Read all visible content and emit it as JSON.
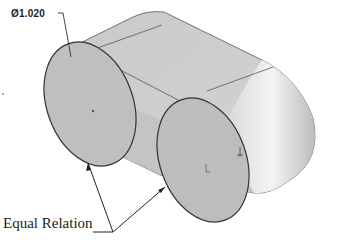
{
  "diagram": {
    "type": "CAD isometric view",
    "part": "slot / obround extrusion with two circular end faces",
    "dimension": {
      "symbol": "⌀",
      "value": "1.020",
      "label": "Ø1.020"
    },
    "callout": {
      "label": "Equal Relation",
      "targets": [
        "left-circle-edge",
        "right-circle-edge"
      ]
    },
    "colors": {
      "body_fill": "#c8c8c8",
      "face_fill": "#bdbdbd",
      "edge": "#333333",
      "background": "#ffffff"
    }
  }
}
